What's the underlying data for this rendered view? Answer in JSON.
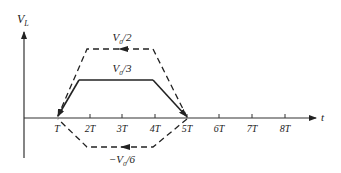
{
  "diagram": {
    "y_axis_label": "V",
    "y_axis_label_sub": "L",
    "x_axis_label": "t",
    "x_ticks": [
      "T",
      "2T",
      "3T",
      "4T",
      "5T",
      "6T",
      "7T",
      "8T"
    ],
    "curves": [
      {
        "name": "upper-dashed",
        "style": "dashed",
        "label_main": "V",
        "label_sub": "0",
        "label_rest": "/2",
        "level": "V0/2"
      },
      {
        "name": "middle-solid",
        "style": "solid",
        "label_main": "V",
        "label_sub": "0",
        "label_rest": "/3",
        "level": "V0/3"
      },
      {
        "name": "lower-dashed",
        "style": "dashed",
        "label_main": "−V",
        "label_sub": "0",
        "label_rest": "/6",
        "level": "-V0/6"
      }
    ],
    "colors": {
      "line": "#222222",
      "background": "#ffffff"
    }
  }
}
